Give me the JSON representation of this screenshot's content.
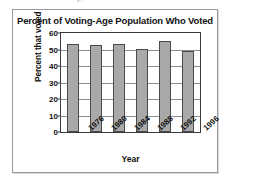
{
  "page": {
    "top_fragment_text": "En Val    Defe    Gate    Galy, Len    Rieen"
  },
  "chart_data": {
    "type": "bar",
    "title": "Percent of Voting-Age Population Who Voted",
    "xlabel": "Year",
    "ylabel": "Percent that voted",
    "categories": [
      "1976",
      "1980",
      "1984",
      "1988",
      "1992",
      "1996"
    ],
    "values": [
      53.5,
      52.8,
      53.3,
      50.3,
      55.2,
      49.0
    ],
    "ylim": [
      0,
      60
    ],
    "yticks": [
      0,
      10,
      20,
      30,
      40,
      50,
      60
    ],
    "grid": true,
    "legend": false,
    "bar_color": "#a9a9a9",
    "bar_edge_color": "#4a4a4a"
  }
}
